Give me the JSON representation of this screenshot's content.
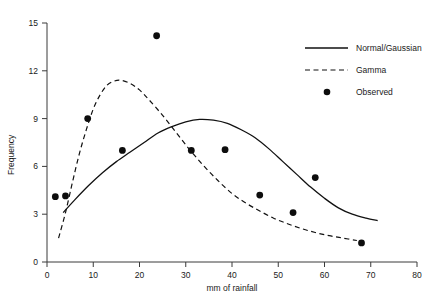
{
  "chart_data": {
    "type": "scatter",
    "title": "",
    "xlabel": "mm of rainfall",
    "ylabel": "Frequency",
    "xlim": [
      0,
      80
    ],
    "ylim": [
      0,
      15
    ],
    "xticks": [
      0,
      10,
      20,
      30,
      40,
      50,
      60,
      70,
      80
    ],
    "yticks": [
      0,
      3,
      6,
      9,
      12,
      15
    ],
    "xtick_labels": [
      "0",
      "10",
      "20",
      "30",
      "40",
      "50",
      "60",
      "70",
      "80"
    ],
    "ytick_labels": [
      "0",
      "3",
      "6",
      "9",
      "12",
      "15"
    ],
    "grid": false,
    "legend_position": "top-right",
    "legend": [
      {
        "label": "Normal/Gaussian",
        "marker": "solid-line"
      },
      {
        "label": "Gamma",
        "marker": "dashed-line"
      },
      {
        "label": "Observed",
        "marker": "filled-circle"
      }
    ],
    "series": [
      {
        "name": "Normal/Gaussian",
        "type": "line",
        "style": "solid",
        "points": [
          [
            3.5,
            3.1
          ],
          [
            6,
            3.9
          ],
          [
            9,
            4.8
          ],
          [
            12,
            5.6
          ],
          [
            15,
            6.3
          ],
          [
            18,
            6.9
          ],
          [
            21,
            7.5
          ],
          [
            24,
            8.1
          ],
          [
            27,
            8.5
          ],
          [
            30,
            8.8
          ],
          [
            33,
            8.95
          ],
          [
            36,
            8.9
          ],
          [
            39,
            8.7
          ],
          [
            42,
            8.3
          ],
          [
            45,
            7.8
          ],
          [
            48,
            7.1
          ],
          [
            51,
            6.3
          ],
          [
            54,
            5.5
          ],
          [
            57,
            4.7
          ],
          [
            60,
            4.0
          ],
          [
            63,
            3.4
          ],
          [
            66,
            3.0
          ],
          [
            69,
            2.75
          ],
          [
            71.5,
            2.6
          ]
        ]
      },
      {
        "name": "Gamma",
        "type": "line",
        "style": "dashed",
        "points": [
          [
            2.5,
            1.5
          ],
          [
            4,
            3.1
          ],
          [
            5.5,
            5.0
          ],
          [
            7,
            6.8
          ],
          [
            8.5,
            8.3
          ],
          [
            10,
            9.6
          ],
          [
            11.5,
            10.5
          ],
          [
            13,
            11.1
          ],
          [
            14.5,
            11.35
          ],
          [
            16,
            11.4
          ],
          [
            18,
            11.2
          ],
          [
            20,
            10.8
          ],
          [
            22,
            10.2
          ],
          [
            25,
            9.2
          ],
          [
            28,
            8.1
          ],
          [
            31,
            7.0
          ],
          [
            34,
            6.0
          ],
          [
            37,
            5.1
          ],
          [
            40,
            4.3
          ],
          [
            43,
            3.7
          ],
          [
            46,
            3.2
          ],
          [
            49,
            2.75
          ],
          [
            52,
            2.4
          ],
          [
            55,
            2.1
          ],
          [
            58,
            1.85
          ],
          [
            61,
            1.65
          ],
          [
            64,
            1.5
          ],
          [
            67,
            1.35
          ]
        ]
      },
      {
        "name": "Observed",
        "type": "scatter",
        "points": [
          [
            1.8,
            4.1
          ],
          [
            4.0,
            4.15
          ],
          [
            8.8,
            9.0
          ],
          [
            16.3,
            7.0
          ],
          [
            23.7,
            14.2
          ],
          [
            31.2,
            7.0
          ],
          [
            38.5,
            7.05
          ],
          [
            46.0,
            4.2
          ],
          [
            53.2,
            3.1
          ],
          [
            58.0,
            5.3
          ],
          [
            68.0,
            1.2
          ]
        ]
      }
    ]
  }
}
